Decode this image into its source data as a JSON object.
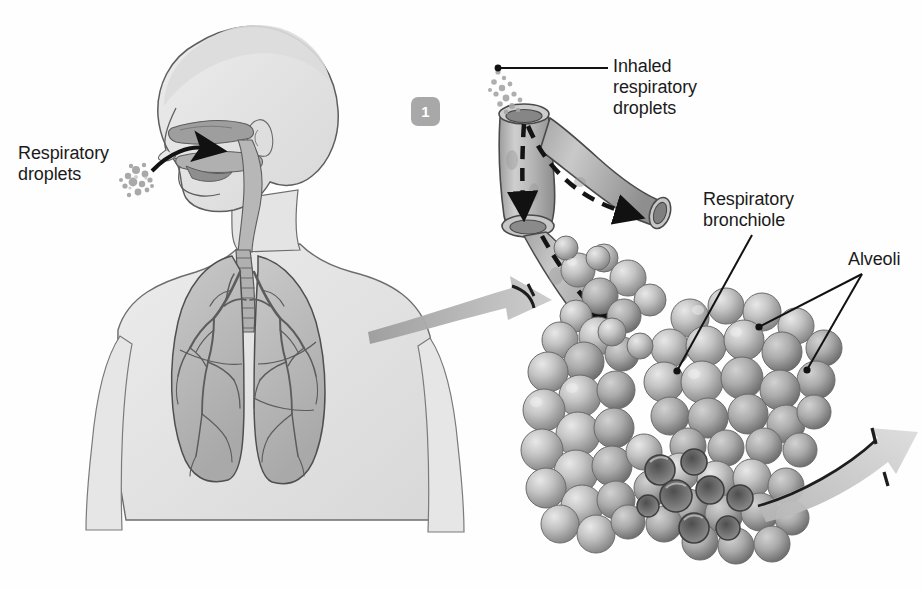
{
  "figure": {
    "background_color": "#fefefe",
    "step_badges": [
      {
        "number": "1",
        "x": 411,
        "y": 97,
        "color": "#a8a8a8",
        "text_color": "#ffffff"
      }
    ]
  },
  "labels": {
    "respiratory_droplets": "Respiratory\ndroplets",
    "inhaled_respiratory_droplets": "Inhaled\nrespiratory\ndroplets",
    "respiratory_bronchiole": "Respiratory\nbronchiole",
    "alveoli": "Alveoli"
  },
  "illustrations": {
    "human_torso": {
      "name": "human head neck and thorax in profile with respiratory tract",
      "fill": "#e3e3e3",
      "outline": "#3a3a3a"
    },
    "lungs": {
      "name": "paired lungs with bronchial tree",
      "fill": "#bdbdbd",
      "bronchial_tree_color": "#6e6e6e"
    },
    "bronchiole_tube": {
      "name": "branching bronchiole cutaway tube",
      "fill": "#b9b9b9",
      "lumen": "#8c8c8c",
      "airflow_arrows": 2,
      "arrow_style": "dashed"
    },
    "alveolar_clusters": {
      "name": "grape-like clusters of alveolar sacs",
      "sac_fill": "#c0c0c0",
      "sac_shadow": "#8a8a8a",
      "cutaway_cavity": "#6a6a6a",
      "cluster_count": 4
    },
    "droplet_clusters": [
      {
        "name": "droplets near mouth",
        "color": "#9a9a9a"
      },
      {
        "name": "droplets entering bronchiole",
        "color": "#9a9a9a"
      }
    ],
    "magnify_arrows": [
      {
        "name": "torso to bronchiole magnifier arrow",
        "color": "#b0b0b0"
      },
      {
        "name": "alveoli to next panel magnifier arrow",
        "color": "#c2c2c2"
      }
    ],
    "inhale_arrow": {
      "name": "curved black arrow into mouth",
      "color": "#111111"
    }
  }
}
